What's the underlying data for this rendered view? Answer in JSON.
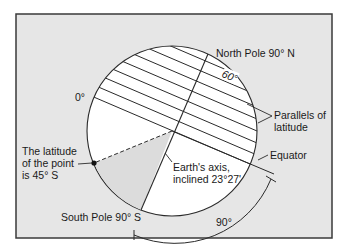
{
  "diagram": {
    "colors": {
      "frame_bg": "#e6e6e6",
      "frame_border": "#3a3a3a",
      "globe_fill": "#ffffff",
      "wedge_fill": "#dcdcdc",
      "line": "#2a2a2a"
    },
    "labels": {
      "north_pole": "North Pole 90° N",
      "south_pole": "South Pole 90° S",
      "zero": "0°",
      "sixty": "60°",
      "ninety": "90°",
      "parallels_line1": "Parallels of",
      "parallels_line2": "latitude",
      "equator": "Equator",
      "axis_line1": "Earth's axis,",
      "axis_line2": "inclined 23°27'",
      "point_line1": "The latitude",
      "point_line2": "of the point",
      "point_line3": "is 45° S"
    }
  }
}
